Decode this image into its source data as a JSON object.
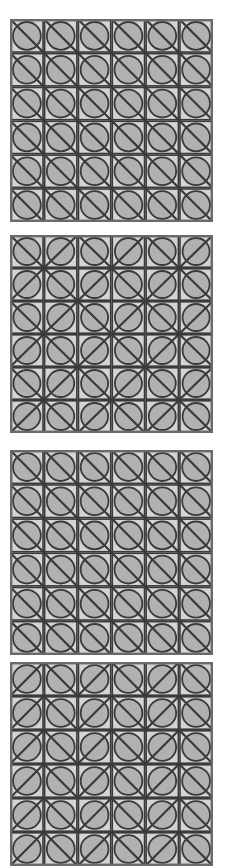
{
  "figure": {
    "background_color": "#ffffff",
    "panel_count": 4,
    "grid_rows": 6,
    "grid_cols": 6
  },
  "style": {
    "cell_fill": "#d4d4d4",
    "circle_fill": "#b1b1b1",
    "stroke_color": "#3a3a3a",
    "outer_border_color": "#6a6a6a",
    "cell_stroke_width": 1.6,
    "diagonal_stroke_width": 2.2,
    "circle_stroke_width": 1.8,
    "outer_border_width": 2.4
  },
  "panels": [
    {
      "id": "panel-1",
      "label": "Panel 1",
      "x": 10,
      "y": 19,
      "width": 203,
      "height": 203,
      "pattern_name": "uniform-nwse",
      "diagonals": [
        [
          "nwse",
          "nwse",
          "nwse",
          "nwse",
          "nwse",
          "nwse"
        ],
        [
          "nwse",
          "nwse",
          "nwse",
          "nwse",
          "nwse",
          "nwse"
        ],
        [
          "nwse",
          "nwse",
          "nwse",
          "nwse",
          "nwse",
          "nwse"
        ],
        [
          "nwse",
          "nwse",
          "nwse",
          "nwse",
          "nwse",
          "nwse"
        ],
        [
          "nwse",
          "nwse",
          "nwse",
          "nwse",
          "nwse",
          "nwse"
        ],
        [
          "nwse",
          "nwse",
          "nwse",
          "nwse",
          "nwse",
          "nwse"
        ]
      ]
    },
    {
      "id": "panel-2",
      "label": "Panel 2",
      "x": 10,
      "y": 235,
      "width": 203,
      "height": 198,
      "pattern_name": "checker-alternating-x",
      "diagonals": [
        [
          "nwse",
          "nesw",
          "nwse",
          "nesw",
          "nwse",
          "nesw"
        ],
        [
          "nesw",
          "nwse",
          "nesw",
          "nwse",
          "nesw",
          "nwse"
        ],
        [
          "nwse",
          "nesw",
          "nwse",
          "nesw",
          "nwse",
          "nesw"
        ],
        [
          "nesw",
          "nwse",
          "nesw",
          "nwse",
          "nesw",
          "nwse"
        ],
        [
          "nwse",
          "nesw",
          "nwse",
          "nesw",
          "nwse",
          "nesw"
        ],
        [
          "nesw",
          "nwse",
          "nesw",
          "nwse",
          "nesw",
          "nwse"
        ]
      ]
    },
    {
      "id": "panel-3",
      "label": "Panel 3",
      "x": 10,
      "y": 450,
      "width": 203,
      "height": 205,
      "pattern_name": "uniform-nwse",
      "diagonals": [
        [
          "nwse",
          "nwse",
          "nwse",
          "nwse",
          "nwse",
          "nwse"
        ],
        [
          "nwse",
          "nwse",
          "nwse",
          "nwse",
          "nwse",
          "nwse"
        ],
        [
          "nwse",
          "nwse",
          "nwse",
          "nwse",
          "nwse",
          "nwse"
        ],
        [
          "nwse",
          "nwse",
          "nwse",
          "nwse",
          "nwse",
          "nwse"
        ],
        [
          "nwse",
          "nwse",
          "nwse",
          "nwse",
          "nwse",
          "nwse"
        ],
        [
          "nwse",
          "nwse",
          "nwse",
          "nwse",
          "nwse",
          "nwse"
        ]
      ]
    },
    {
      "id": "panel-4",
      "label": "Panel 4",
      "x": 10,
      "y": 662,
      "width": 203,
      "height": 204,
      "pattern_name": "checker-alternating-x-offset",
      "diagonals": [
        [
          "nesw",
          "nwse",
          "nesw",
          "nwse",
          "nesw",
          "nwse"
        ],
        [
          "nesw",
          "nwse",
          "nesw",
          "nwse",
          "nesw",
          "nwse"
        ],
        [
          "nesw",
          "nwse",
          "nesw",
          "nwse",
          "nesw",
          "nwse"
        ],
        [
          "nesw",
          "nwse",
          "nesw",
          "nwse",
          "nesw",
          "nwse"
        ],
        [
          "nesw",
          "nwse",
          "nesw",
          "nwse",
          "nesw",
          "nwse"
        ],
        [
          "nesw",
          "nwse",
          "nesw",
          "nwse",
          "nesw",
          "nwse"
        ]
      ]
    }
  ]
}
